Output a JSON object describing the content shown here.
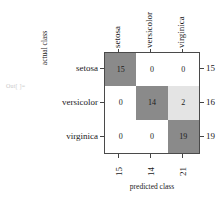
{
  "notebook": {
    "out_prompt": "Out[ ]="
  },
  "axes": {
    "y_title": "actual class",
    "x_title": "predicted class"
  },
  "chart_data": {
    "type": "heatmap",
    "title": "",
    "subtitle": "",
    "xlabel": "predicted class",
    "ylabel": "actual class",
    "categories": [
      "setosa",
      "versicolor",
      "virginica"
    ],
    "row_labels": [
      "setosa",
      "versicolor",
      "virginica"
    ],
    "col_labels": [
      "setosa",
      "versicolor",
      "virginica"
    ],
    "matrix": [
      [
        15,
        0,
        0
      ],
      [
        0,
        14,
        2
      ],
      [
        0,
        0,
        19
      ]
    ],
    "row_totals": [
      15,
      16,
      19
    ],
    "col_totals": [
      15,
      14,
      21
    ],
    "cell_levels": [
      [
        "high",
        "zero",
        "zero"
      ],
      [
        "zero",
        "high",
        "low"
      ],
      [
        "zero",
        "zero",
        "high"
      ]
    ],
    "colors": {
      "high": "#8a8a8a",
      "low": "#e4e4e4",
      "zero": "#ffffff",
      "border": "#4a4a4a",
      "text": "#1a1a1a",
      "prompt": "#c9c9c9"
    },
    "grid": true,
    "legend": "none"
  }
}
